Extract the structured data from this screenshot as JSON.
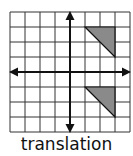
{
  "diagram": {
    "caption": "translation",
    "grid": {
      "cols": 8,
      "rows": 8,
      "cell": 15,
      "origin_x": 10,
      "origin_y": 12,
      "line_color": "#333333"
    },
    "axes": {
      "x_axis_row": 4,
      "y_axis_col": 4,
      "color": "#111111"
    },
    "shapes": [
      {
        "name": "original-triangle",
        "points": [
          [
            5,
            1
          ],
          [
            7,
            1
          ],
          [
            7,
            3
          ]
        ],
        "fill": "#8a8a8a"
      },
      {
        "name": "translated-triangle",
        "points": [
          [
            5,
            5
          ],
          [
            7,
            5
          ],
          [
            7,
            7
          ]
        ],
        "fill": "#8a8a8a"
      }
    ]
  }
}
